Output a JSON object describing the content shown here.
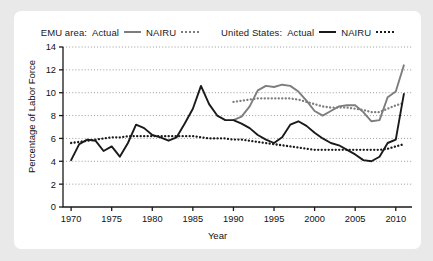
{
  "chart_data": {
    "type": "line",
    "title": "",
    "xlabel": "Year",
    "ylabel": "Percentage of Labor Force",
    "xlim": [
      1969,
      2012
    ],
    "ylim": [
      0,
      14
    ],
    "xticks": [
      1970,
      1975,
      1980,
      1985,
      1990,
      1995,
      2000,
      2005,
      2010
    ],
    "yticks": [
      0,
      2,
      4,
      6,
      8,
      10,
      12,
      14
    ],
    "grid": "horizontal-dotted",
    "legend_position": "top-center",
    "colors": {
      "emu": "#7d7d7d",
      "us": "#1a1a1a",
      "grid": "#9a9a9a",
      "axis": "#1a1a1a",
      "panel": "#ffffff",
      "background": "#e9e9e9"
    },
    "legend": [
      {
        "group": "EMU area:",
        "actual_label": "Actual",
        "nairu_label": "NAIRU",
        "color": "#7d7d7d"
      },
      {
        "group": "United States:",
        "actual_label": "Actual",
        "nairu_label": "NAIRU",
        "color": "#1a1a1a"
      }
    ],
    "series": [
      {
        "name": "EMU area: Actual",
        "style": "solid",
        "color": "#7d7d7d",
        "x": [
          1990,
          1991,
          1992,
          1993,
          1994,
          1995,
          1996,
          1997,
          1998,
          1999,
          2000,
          2001,
          2002,
          2003,
          2004,
          2005,
          2006,
          2007,
          2008,
          2009,
          2010,
          2011
        ],
        "values": [
          7.6,
          7.9,
          8.8,
          10.2,
          10.6,
          10.5,
          10.7,
          10.6,
          10.1,
          9.3,
          8.4,
          8.0,
          8.4,
          8.8,
          8.9,
          8.9,
          8.3,
          7.5,
          7.6,
          9.6,
          10.1,
          12.4
        ]
      },
      {
        "name": "EMU area: NAIRU",
        "style": "dotted",
        "color": "#7d7d7d",
        "x": [
          1990,
          1991,
          1992,
          1993,
          1994,
          1995,
          1996,
          1997,
          1998,
          1999,
          2000,
          2001,
          2002,
          2003,
          2004,
          2005,
          2006,
          2007,
          2008,
          2009,
          2010,
          2011
        ],
        "values": [
          9.2,
          9.3,
          9.4,
          9.5,
          9.5,
          9.5,
          9.5,
          9.5,
          9.4,
          9.2,
          9.0,
          8.8,
          8.7,
          8.7,
          8.7,
          8.6,
          8.5,
          8.3,
          8.3,
          8.6,
          8.9,
          9.1
        ]
      },
      {
        "name": "United States: Actual",
        "style": "solid",
        "color": "#1a1a1a",
        "x": [
          1970,
          1971,
          1972,
          1973,
          1974,
          1975,
          1976,
          1977,
          1978,
          1979,
          1980,
          1981,
          1982,
          1983,
          1984,
          1985,
          1986,
          1987,
          1988,
          1989,
          1990,
          1991,
          1992,
          1993,
          1994,
          1995,
          1996,
          1997,
          1998,
          1999,
          2000,
          2001,
          2002,
          2003,
          2004,
          2005,
          2006,
          2007,
          2008,
          2009,
          2010,
          2011
        ],
        "values": [
          4.1,
          5.5,
          5.9,
          5.8,
          4.9,
          5.3,
          4.4,
          5.6,
          7.2,
          6.9,
          6.3,
          6.1,
          5.8,
          6.1,
          7.3,
          8.6,
          10.6,
          9.0,
          8.0,
          7.6,
          7.6,
          7.3,
          6.9,
          6.3,
          5.9,
          5.6,
          6.1,
          7.2,
          7.5,
          7.1,
          6.5,
          6.0,
          5.6,
          5.4,
          5.0,
          4.6,
          4.1,
          4.0,
          4.4,
          5.6,
          5.9,
          9.9
        ]
      },
      {
        "name": "United States: NAIRU",
        "style": "dotted",
        "color": "#1a1a1a",
        "x": [
          1970,
          1971,
          1972,
          1973,
          1974,
          1975,
          1976,
          1977,
          1978,
          1979,
          1980,
          1981,
          1982,
          1983,
          1984,
          1985,
          1986,
          1987,
          1988,
          1989,
          1990,
          1991,
          1992,
          1993,
          1994,
          1995,
          1996,
          1997,
          1998,
          1999,
          2000,
          2001,
          2002,
          2003,
          2004,
          2005,
          2006,
          2007,
          2008,
          2009,
          2010,
          2011
        ],
        "values": [
          5.6,
          5.7,
          5.8,
          5.9,
          6.0,
          6.1,
          6.1,
          6.2,
          6.2,
          6.2,
          6.2,
          6.2,
          6.2,
          6.2,
          6.2,
          6.2,
          6.1,
          6.0,
          6.0,
          6.0,
          5.9,
          5.9,
          5.8,
          5.7,
          5.6,
          5.5,
          5.4,
          5.3,
          5.2,
          5.1,
          5.0,
          5.0,
          5.0,
          5.0,
          5.0,
          5.0,
          5.0,
          5.0,
          5.0,
          5.1,
          5.3,
          5.5
        ]
      }
    ]
  }
}
